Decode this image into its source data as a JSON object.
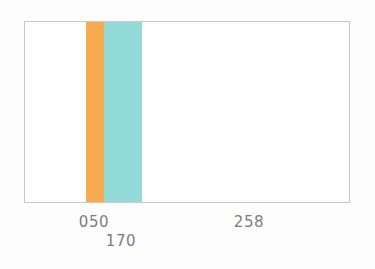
{
  "figure": {
    "background_color": "#fdfdfd",
    "plot_background_color": "#ffffff",
    "frame_color": "#c9c9c9",
    "tick_label_color": "#7d7d7d"
  },
  "chart_data": {
    "type": "bar",
    "title": "",
    "subtitle": "",
    "xlabel": "",
    "ylabel": "",
    "grid": false,
    "legend": null,
    "orientation": "vertical",
    "axis": {
      "x_range": [
        0,
        326
      ],
      "y_range": [
        0,
        1
      ],
      "y_tick_labels": [],
      "x_tick_labels": [
        "050",
        "170",
        "258"
      ],
      "x_tick_positions": [
        94,
        121,
        249
      ],
      "x_tick_label_rows": [
        0,
        1,
        0
      ]
    },
    "categories": [
      "050",
      "170",
      "258"
    ],
    "values": [
      1,
      1,
      0
    ],
    "series": [
      {
        "name": "050",
        "label": "050",
        "color": "#f7ac52",
        "value": 1,
        "x_start": 61,
        "x_width": 18
      },
      {
        "name": "170",
        "label": "170",
        "color": "#92dbd8",
        "value": 1,
        "x_start": 79,
        "x_width": 38
      },
      {
        "name": "258",
        "label": "258",
        "color": "#ffffff",
        "value": 0,
        "x_start": 225,
        "x_width": 0
      }
    ]
  },
  "ticks": [
    {
      "label": "050",
      "left": 94,
      "top": 215
    },
    {
      "label": "170",
      "left": 121,
      "top": 234
    },
    {
      "label": "258",
      "left": 249,
      "top": 215
    }
  ],
  "bars": [
    {
      "name": "bar-orange",
      "color": "#f7ac52",
      "left": 61,
      "width": 18
    },
    {
      "name": "bar-teal",
      "color": "#92dbd8",
      "left": 79,
      "width": 38
    }
  ]
}
